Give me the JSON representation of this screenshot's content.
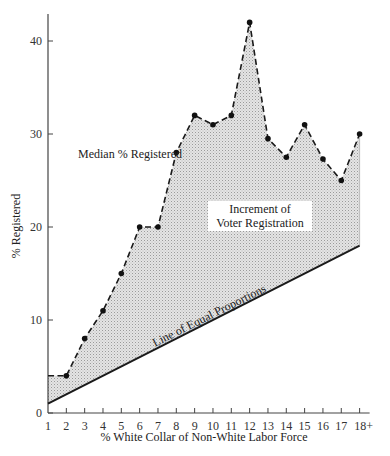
{
  "chart_data": {
    "type": "line",
    "title": "",
    "xlabel": "% White Collar of Non-White Labor Force",
    "ylabel": "% Registered",
    "categories": [
      "1",
      "2",
      "3",
      "4",
      "5",
      "6",
      "7",
      "8",
      "9",
      "10",
      "11",
      "12",
      "13",
      "14",
      "15",
      "16",
      "17",
      "18+"
    ],
    "x_ticks": [
      "1",
      "2",
      "3",
      "4",
      "5",
      "6",
      "7",
      "8",
      "9",
      "10",
      "11",
      "12",
      "13",
      "14",
      "15",
      "16",
      "17",
      "18+"
    ],
    "y_ticks": [
      "0",
      "10",
      "20",
      "30",
      "40"
    ],
    "ylim": [
      0,
      43
    ],
    "grid": false,
    "series": [
      {
        "name": "Median % Registered",
        "style": "dashed with markers",
        "values": [
          4,
          4,
          8,
          11,
          15,
          20,
          20,
          28,
          32,
          31,
          32,
          42,
          29.5,
          27.5,
          31,
          27.3,
          25,
          30
        ]
      },
      {
        "name": "Line of Equal Proportions",
        "style": "solid",
        "values": [
          1,
          2,
          3,
          4,
          5,
          6,
          7,
          8,
          9,
          10,
          11,
          12,
          13,
          14,
          15,
          16,
          17,
          18
        ]
      }
    ],
    "annotations": [
      {
        "text": "Median % Registered",
        "near": "dashed series"
      },
      {
        "text": "Increment of Voter Registration",
        "near": "shaded area"
      },
      {
        "text": "Line of Equal Proportions",
        "near": "solid diagonal line"
      }
    ],
    "shaded_region": "between Median % Registered and Line of Equal Proportions"
  },
  "labels": {
    "xlabel": "% White Collar of Non-White Labor Force",
    "ylabel": "% Registered",
    "median": "Median % Registered",
    "increment_line1": "Increment of",
    "increment_line2": "Voter Registration",
    "equal": "Line of Equal Proportions"
  }
}
